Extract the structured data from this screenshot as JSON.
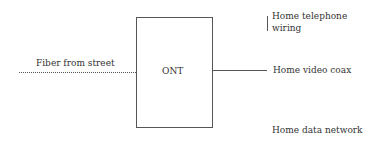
{
  "diagram": {
    "device": {
      "label": "ONT"
    },
    "inputs": [
      {
        "label": "Fiber from street",
        "style": "dotted"
      }
    ],
    "outputs": [
      {
        "label": "Home telephone wiring",
        "line1": "Home telephone",
        "line2": "wiring"
      },
      {
        "label": "Home video coax"
      },
      {
        "label": "Home data network"
      }
    ],
    "colors": {
      "line": "#555555",
      "text": "#333333",
      "background": "#ffffff"
    }
  }
}
